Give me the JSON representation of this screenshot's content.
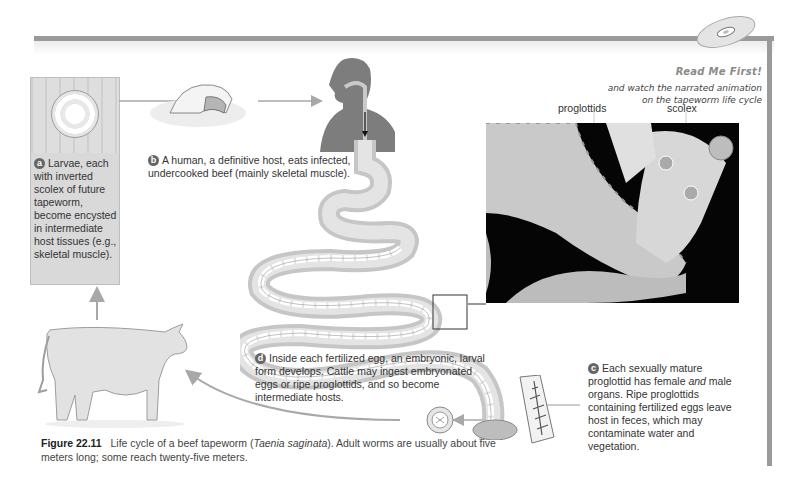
{
  "header": {
    "cd_icon": "cd-disc-icon",
    "read_me_first": "Read Me First!",
    "watch_line1": "and watch the narrated animation",
    "watch_line2": "on the tapeworm life cycle"
  },
  "steps": {
    "a": {
      "badge": "a",
      "text": "Larvae, each with inverted scolex of future tapeworm, become encysted in intermediate host tissues (e.g., skeletal muscle)."
    },
    "b": {
      "badge": "b",
      "text": "A human, a definitive host, eats infected, undercooked beef (mainly skeletal muscle)."
    },
    "c": {
      "badge": "c",
      "text_before_italic": "Each sexually mature proglottid has female ",
      "italic": "and",
      "text_after_italic": " male organs. Ripe proglottids containing fertilized eggs leave host in feces, which may contaminate water and vegetation."
    },
    "d": {
      "badge": "d",
      "text": "Inside each fertilized egg, an embryonic, larval form develops. Cattle may ingest embryonated eggs or ripe proglottids, and so become intermediate hosts."
    }
  },
  "photo_labels": {
    "proglottids": "proglottids",
    "scolex": "scolex"
  },
  "caption": {
    "figure_label": "Figure 22.11",
    "text_before_italic": "Life cycle of a beef tapeworm (",
    "italic": "Taenia saginata",
    "text_after_italic": "). Adult worms are usually about five meters long; some reach twenty-five meters."
  },
  "colors": {
    "frame": "#9a9a9a",
    "badge": "#666666",
    "arrow": "#a8a8a8",
    "text": "#333333"
  }
}
